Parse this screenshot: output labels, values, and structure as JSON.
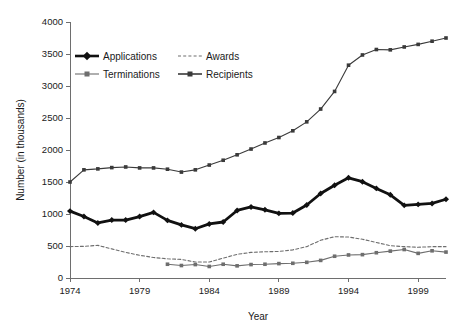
{
  "chart_data": {
    "type": "line",
    "title": "",
    "xlabel": "Year",
    "ylabel": "Number (in thousands)",
    "xlim": [
      1974,
      2001
    ],
    "ylim": [
      0,
      4000
    ],
    "xticks": [
      1974,
      1979,
      1984,
      1989,
      1994,
      1999
    ],
    "yticks": [
      0,
      500,
      1000,
      1500,
      2000,
      2500,
      3000,
      3500,
      4000
    ],
    "grid": false,
    "legend_position": "upper-left-inside",
    "series": [
      {
        "name": "Applications",
        "color": "#111111",
        "style": "solid-thick",
        "marker": "diamond",
        "x": [
          1974,
          1975,
          1976,
          1977,
          1978,
          1979,
          1980,
          1981,
          1982,
          1983,
          1984,
          1985,
          1986,
          1987,
          1988,
          1989,
          1990,
          1991,
          1992,
          1993,
          1994,
          1995,
          1996,
          1997,
          1998,
          1999,
          2000,
          2001
        ],
        "values": [
          1045,
          960,
          860,
          905,
          905,
          960,
          1025,
          900,
          830,
          770,
          845,
          875,
          1055,
          1110,
          1065,
          1010,
          1015,
          1140,
          1320,
          1450,
          1565,
          1505,
          1400,
          1300,
          1135,
          1150,
          1165,
          1230
        ]
      },
      {
        "name": "Awards",
        "color": "#6e6e6e",
        "style": "dashed",
        "marker": "none",
        "x": [
          1974,
          1975,
          1976,
          1977,
          1978,
          1979,
          1980,
          1981,
          1982,
          1983,
          1984,
          1985,
          1986,
          1987,
          1988,
          1989,
          1990,
          1991,
          1992,
          1993,
          1994,
          1995,
          1996,
          1997,
          1998,
          1999,
          2000,
          2001
        ],
        "values": [
          490,
          495,
          510,
          455,
          400,
          355,
          320,
          300,
          290,
          250,
          250,
          310,
          370,
          400,
          410,
          415,
          440,
          490,
          590,
          645,
          640,
          605,
          555,
          505,
          490,
          480,
          490,
          490
        ]
      },
      {
        "name": "Terminations",
        "color": "#6e6e6e",
        "style": "solid-thin",
        "marker": "square",
        "x": [
          1981,
          1982,
          1983,
          1984,
          1985,
          1986,
          1987,
          1988,
          1989,
          1990,
          1991,
          1992,
          1993,
          1994,
          1995,
          1996,
          1997,
          1998,
          1999,
          2000,
          2001
        ],
        "values": [
          215,
          195,
          210,
          180,
          215,
          190,
          210,
          215,
          225,
          230,
          245,
          275,
          340,
          360,
          365,
          395,
          420,
          445,
          385,
          425,
          405
        ]
      },
      {
        "name": "Recipients",
        "color": "#3a3a3a",
        "style": "solid-thin",
        "marker": "square",
        "x": [
          1974,
          1975,
          1976,
          1977,
          1978,
          1979,
          1980,
          1981,
          1982,
          1983,
          1984,
          1985,
          1986,
          1987,
          1988,
          1989,
          1990,
          1991,
          1992,
          1993,
          1994,
          1995,
          1996,
          1997,
          1998,
          1999,
          2000,
          2001
        ],
        "values": [
          1500,
          1690,
          1705,
          1725,
          1735,
          1720,
          1720,
          1700,
          1655,
          1690,
          1765,
          1840,
          1925,
          2015,
          2110,
          2195,
          2300,
          2440,
          2640,
          2915,
          3325,
          3485,
          3570,
          3565,
          3610,
          3650,
          3700,
          3750
        ]
      }
    ]
  },
  "legend": {
    "items": [
      {
        "label": "Applications",
        "key": "applications"
      },
      {
        "label": "Awards",
        "key": "awards"
      },
      {
        "label": "Terminations",
        "key": "terminations"
      },
      {
        "label": "Recipients",
        "key": "recipients"
      }
    ]
  },
  "axes": {
    "y_title": "Number (in thousands)",
    "x_title": "Year",
    "y_tick_labels": [
      "0",
      "500",
      "1000",
      "1500",
      "2000",
      "2500",
      "3000",
      "3500",
      "4000"
    ],
    "x_tick_labels": [
      "1974",
      "1979",
      "1984",
      "1989",
      "1994",
      "1999"
    ]
  },
  "colors": {
    "applications": "#111111",
    "awards": "#6e6e6e",
    "terminations": "#6e6e6e",
    "recipients": "#3a3a3a",
    "axis": "#6e6e6e",
    "text": "#1a1a1a",
    "background": "#ffffff"
  }
}
